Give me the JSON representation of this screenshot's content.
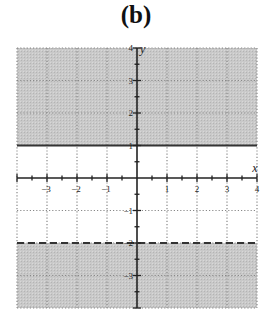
{
  "title": "(b)",
  "colors": {
    "shade": "#c9c9c9",
    "grid": "#888888",
    "axis": "#222222",
    "boundary": "#333333",
    "background": "#ffffff"
  },
  "chart_data": {
    "type": "area",
    "title": "(b)",
    "xlabel": "x",
    "ylabel": "y",
    "xlim": [
      -4,
      4
    ],
    "ylim": [
      -4,
      4
    ],
    "grid": true,
    "x_ticks": [
      -3,
      -2,
      -1,
      1,
      2,
      3,
      4
    ],
    "y_ticks": [
      4,
      3,
      2,
      1,
      -1,
      -2,
      -3
    ],
    "x_tick_labels": [
      "-3",
      "-2",
      "-1",
      "1",
      "2",
      "3",
      "4"
    ],
    "y_tick_labels": [
      "4",
      "3",
      "2",
      "1",
      "-1",
      "-2",
      "-3"
    ],
    "boundaries": [
      {
        "equation": "y = 1",
        "y": 1,
        "style": "solid"
      },
      {
        "equation": "y = -2",
        "y": -2,
        "style": "dashed"
      }
    ],
    "shaded_regions": [
      {
        "description": "y >= 1",
        "y_from": 1,
        "y_to": 4
      },
      {
        "description": "y < -2",
        "y_from": -4,
        "y_to": -2
      }
    ],
    "inequality": "y >= 1 or y < -2"
  }
}
